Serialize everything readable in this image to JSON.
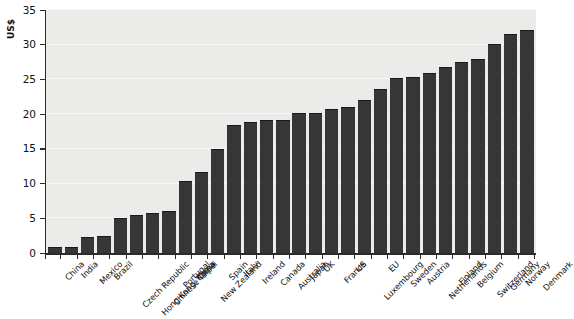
{
  "chart_data": {
    "type": "bar",
    "title": "",
    "subtitle": "",
    "xlabel": "",
    "ylabel": "US$",
    "ylim": [
      0,
      35
    ],
    "yticks": [
      0,
      5,
      10,
      15,
      20,
      25,
      30,
      35
    ],
    "ytick_labels": [
      "0",
      "5",
      "10",
      "15",
      "20",
      "25",
      "30",
      "35"
    ],
    "grid": true,
    "grid_axis": "y",
    "legend": false,
    "legend_position": "none",
    "bar_color": "#363636",
    "plot_background": "#ebebea",
    "categories": [
      "China",
      "India",
      "Mexico",
      "Brazil",
      "Czech Republic",
      "Hong Kong, China",
      "Chinese Taipei",
      "Portugal",
      "Korea",
      "New Zealand",
      "Spain",
      "Italy",
      "Ireland",
      "Canada",
      "Australia",
      "Japan",
      "UK",
      "France",
      "US",
      "Luxembourg",
      "EU",
      "Sweden",
      "Austria",
      "Netherlands",
      "Finland",
      "Belgium",
      "Switzerland",
      "Germany",
      "Norway",
      "Denmark"
    ],
    "values": [
      0.8,
      0.8,
      2.3,
      2.4,
      5.0,
      5.5,
      5.7,
      6.1,
      10.4,
      11.6,
      15.0,
      18.4,
      18.9,
      19.1,
      19.2,
      20.1,
      20.2,
      20.7,
      21.0,
      22.1,
      23.6,
      25.2,
      25.3,
      26.0,
      26.8,
      27.5,
      27.9,
      30.1,
      31.5,
      32.1
    ]
  }
}
